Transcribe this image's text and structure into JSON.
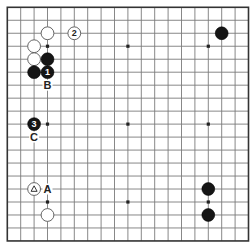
{
  "board": {
    "size": 19,
    "origin_x": 7.3,
    "origin_y": 7.3,
    "spacing_x": 13.4,
    "spacing_y": 12.98,
    "stone_radius": 6.4,
    "colors": {
      "background": "#ffffff",
      "grid": "#7a7a7a",
      "edge": "#333333",
      "black_stone": "#151515",
      "white_stone": "#ffffff"
    }
  },
  "star_points": [
    {
      "col": 3,
      "row": 3
    },
    {
      "col": 9,
      "row": 3
    },
    {
      "col": 15,
      "row": 3
    },
    {
      "col": 3,
      "row": 9
    },
    {
      "col": 9,
      "row": 9
    },
    {
      "col": 15,
      "row": 9
    },
    {
      "col": 3,
      "row": 15
    },
    {
      "col": 9,
      "row": 15
    },
    {
      "col": 15,
      "row": 15
    }
  ],
  "stones": [
    {
      "color": "white",
      "col": 3,
      "row": 2,
      "label": "",
      "mark": ""
    },
    {
      "color": "white",
      "col": 5,
      "row": 2,
      "label": "2",
      "mark": ""
    },
    {
      "color": "black",
      "col": 16,
      "row": 2,
      "label": "",
      "mark": ""
    },
    {
      "color": "white",
      "col": 2,
      "row": 3,
      "label": "",
      "mark": ""
    },
    {
      "color": "white",
      "col": 2,
      "row": 4,
      "label": "",
      "mark": ""
    },
    {
      "color": "black",
      "col": 3,
      "row": 4,
      "label": "",
      "mark": ""
    },
    {
      "color": "black",
      "col": 2,
      "row": 5,
      "label": "",
      "mark": ""
    },
    {
      "color": "black",
      "col": 3,
      "row": 5,
      "label": "1",
      "mark": ""
    },
    {
      "color": "black",
      "col": 2,
      "row": 9,
      "label": "3",
      "mark": ""
    },
    {
      "color": "white",
      "col": 2,
      "row": 14,
      "label": "",
      "mark": "triangle"
    },
    {
      "color": "white",
      "col": 3,
      "row": 16,
      "label": "",
      "mark": ""
    },
    {
      "color": "black",
      "col": 15,
      "row": 14,
      "label": "",
      "mark": ""
    },
    {
      "color": "black",
      "col": 15,
      "row": 16,
      "label": "",
      "mark": ""
    }
  ],
  "labels": [
    {
      "text": "B",
      "col": 3,
      "row": 6
    },
    {
      "text": "C",
      "col": 2,
      "row": 10
    },
    {
      "text": "A",
      "col": 3,
      "row": 14
    }
  ]
}
